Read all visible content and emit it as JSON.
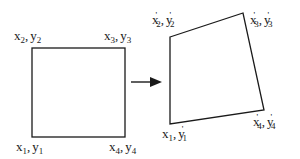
{
  "diagram": {
    "source_square": {
      "corners": [
        {
          "id": "p1",
          "label_x": "x",
          "sub": "1",
          "label_y": "y",
          "text": "x1, y1",
          "position": "bottom-left"
        },
        {
          "id": "p2",
          "label_x": "x",
          "sub": "2",
          "label_y": "y",
          "text": "x2, y2",
          "position": "top-left"
        },
        {
          "id": "p3",
          "label_x": "x",
          "sub": "3",
          "label_y": "y",
          "text": "x3, y3",
          "position": "top-right"
        },
        {
          "id": "p4",
          "label_x": "x",
          "sub": "4",
          "label_y": "y",
          "text": "x4, y4",
          "position": "bottom-right"
        }
      ]
    },
    "arrow": {
      "direction": "right",
      "meaning": "maps to"
    },
    "target_quad": {
      "corners": [
        {
          "id": "q1",
          "label_x": "x'",
          "sub": "1",
          "label_y": "y'",
          "text": "x'1, y'1",
          "position": "bottom-left"
        },
        {
          "id": "q2",
          "label_x": "x'",
          "sub": "2",
          "label_y": "y'",
          "text": "x'2, y'2",
          "position": "top-left"
        },
        {
          "id": "q3",
          "label_x": "x'",
          "sub": "3",
          "label_y": "y'",
          "text": "x'3, y'3",
          "position": "top-right"
        },
        {
          "id": "q4",
          "label_x": "x'",
          "sub": "4",
          "label_y": "y'",
          "text": "x'4, y'4",
          "position": "bottom-right"
        }
      ]
    },
    "labels": {
      "s_x": "x",
      "s_y": "y",
      "comma": ",",
      "prime": "'",
      "n1": "1",
      "n2": "2",
      "n3": "3",
      "n4": "4"
    },
    "colors": {
      "stroke": "#1a1a1a",
      "background": "#ffffff"
    }
  }
}
